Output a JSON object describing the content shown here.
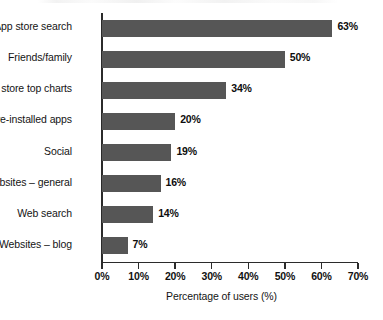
{
  "chart_data": {
    "type": "bar",
    "orientation": "horizontal",
    "title": "",
    "xlabel": "Percentage of users (%)",
    "ylabel": "",
    "xlim": [
      0,
      70
    ],
    "xticks": [
      "0%",
      "10%",
      "20%",
      "30%",
      "40%",
      "50%",
      "60%",
      "70%"
    ],
    "xtick_values": [
      0,
      10,
      20,
      30,
      40,
      50,
      60,
      70
    ],
    "grid": false,
    "legend": false,
    "bar_color": "#565656",
    "axis_color": "#2b2b2b",
    "categories": [
      "App store search",
      "Friends/family",
      "App store top charts",
      "Pre-installed apps",
      "Social",
      "Websites – general",
      "Web search",
      "Websites – blog"
    ],
    "values": [
      63,
      50,
      34,
      20,
      19,
      16,
      14,
      7
    ],
    "data_labels": [
      "63%",
      "50%",
      "34%",
      "20%",
      "19%",
      "16%",
      "14%",
      "7%"
    ]
  }
}
